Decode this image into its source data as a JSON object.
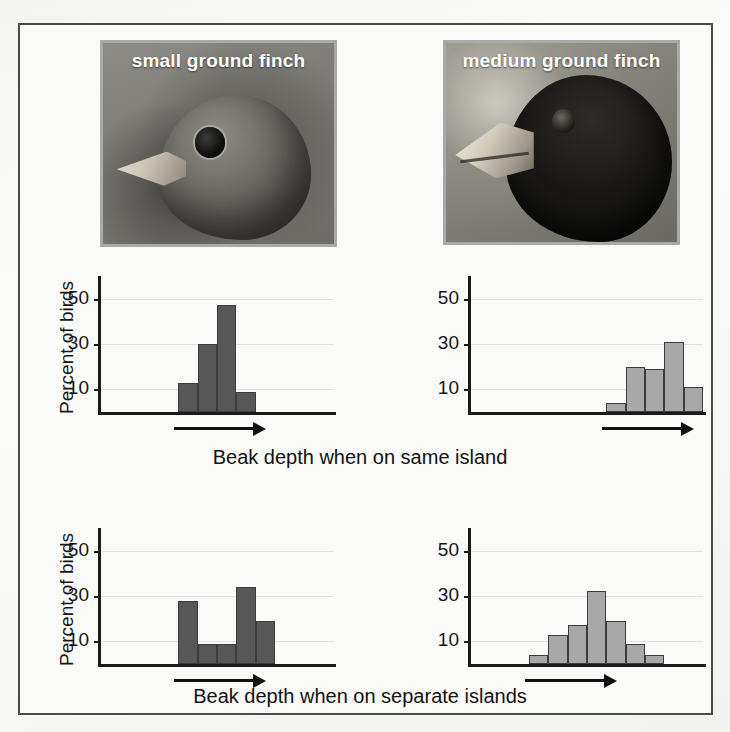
{
  "figure": {
    "background_color": "#f7f7f5",
    "frame_color": "#4a4a4a"
  },
  "photos": [
    {
      "name": "small-ground-finch",
      "caption": "small ground finch"
    },
    {
      "name": "medium-ground-finch",
      "caption": "medium ground finch"
    }
  ],
  "axis": {
    "y_title": "Percent of birds",
    "y_ticks": [
      "50",
      "30",
      "10"
    ],
    "y_tick_values": [
      50,
      30,
      10
    ]
  },
  "captions": {
    "same_island": "Beak depth when on same island",
    "separate_islands": "Beak depth when on separate islands"
  },
  "colors": {
    "bar_dark": "#575757",
    "bar_light": "#a8a8a8",
    "bar_outline": "#3d3d3d",
    "axis": "#1a1a1a",
    "gridline": "#e2e2e0"
  },
  "chart_data": [
    {
      "type": "bar",
      "id": "small-finch-same-island",
      "title": "small ground finch — same island",
      "xlabel": "Beak depth when on same island",
      "ylabel": "Percent of birds",
      "ylim": [
        0,
        60
      ],
      "yticks": [
        10,
        30,
        50
      ],
      "grid": true,
      "legend": "none",
      "bar_color": "#575757",
      "categories": [
        "b1",
        "b2",
        "b3",
        "b4"
      ],
      "values": [
        13,
        30,
        47,
        9
      ],
      "bar_start_index": 4,
      "total_bins": 12,
      "annotations": [
        "arrow indicating increasing beak depth"
      ]
    },
    {
      "type": "bar",
      "id": "medium-finch-same-island",
      "title": "medium ground finch — same island",
      "xlabel": "Beak depth when on same island",
      "ylabel": "Percent of birds",
      "ylim": [
        0,
        60
      ],
      "yticks": [
        10,
        30,
        50
      ],
      "grid": true,
      "legend": "none",
      "bar_color": "#a8a8a8",
      "categories": [
        "b1",
        "b2",
        "b3",
        "b4",
        "b5"
      ],
      "values": [
        4,
        20,
        19,
        31,
        11
      ],
      "bar_start_index": 7,
      "total_bins": 12,
      "annotations": [
        "arrow indicating increasing beak depth"
      ]
    },
    {
      "type": "bar",
      "id": "small-finch-separate-islands",
      "title": "small ground finch — separate islands",
      "xlabel": "Beak depth when on separate islands",
      "ylabel": "Percent of birds",
      "ylim": [
        0,
        60
      ],
      "yticks": [
        10,
        30,
        50
      ],
      "grid": true,
      "legend": "none",
      "bar_color": "#575757",
      "categories": [
        "b1",
        "b2",
        "b3",
        "b4",
        "b5"
      ],
      "values": [
        28,
        9,
        9,
        34,
        19
      ],
      "bar_start_index": 4,
      "total_bins": 12,
      "annotations": [
        "arrow indicating increasing beak depth"
      ]
    },
    {
      "type": "bar",
      "id": "medium-finch-separate-islands",
      "title": "medium ground finch — separate islands",
      "xlabel": "Beak depth when on separate islands",
      "ylabel": "Percent of birds",
      "ylim": [
        0,
        60
      ],
      "yticks": [
        10,
        30,
        50
      ],
      "grid": true,
      "legend": "none",
      "bar_color": "#a8a8a8",
      "categories": [
        "b1",
        "b2",
        "b3",
        "b4",
        "b5",
        "b6",
        "b7"
      ],
      "values": [
        4,
        13,
        17,
        32,
        19,
        9,
        4
      ],
      "bar_start_index": 3,
      "total_bins": 12,
      "annotations": [
        "arrow indicating increasing beak depth"
      ]
    }
  ]
}
